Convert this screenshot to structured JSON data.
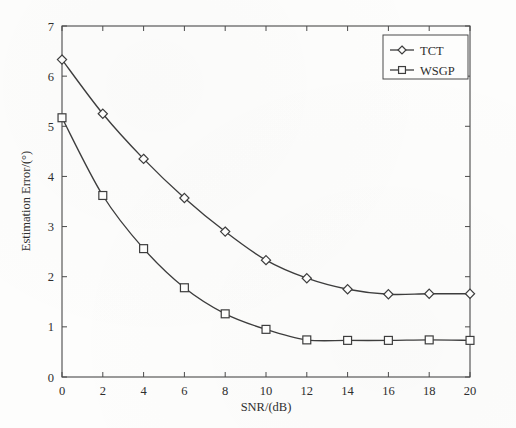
{
  "chart_data": {
    "type": "line",
    "title": "",
    "xlabel": "SNR/(dB)",
    "ylabel": "Estimation Error/(°)",
    "xlim": [
      0,
      20
    ],
    "ylim": [
      0,
      7
    ],
    "xticks": [
      0,
      2,
      4,
      6,
      8,
      10,
      12,
      14,
      16,
      18,
      20
    ],
    "yticks": [
      0,
      1,
      2,
      3,
      4,
      5,
      6,
      7
    ],
    "xtick_labels": [
      "0",
      "2",
      "4",
      "6",
      "8",
      "10",
      "12",
      "14",
      "16",
      "18",
      "20"
    ],
    "ytick_labels": [
      "0",
      "1",
      "2",
      "3",
      "4",
      "5",
      "6",
      "7"
    ],
    "grid": false,
    "legend_position": "upper right",
    "x": [
      0,
      2,
      4,
      6,
      8,
      10,
      12,
      14,
      16,
      18,
      20
    ],
    "series": [
      {
        "name": "TCT",
        "marker": "diamond",
        "values": [
          6.33,
          5.25,
          4.35,
          3.57,
          2.9,
          2.33,
          1.97,
          1.75,
          1.65,
          1.66,
          1.66
        ]
      },
      {
        "name": "WSGP",
        "marker": "square",
        "values": [
          5.17,
          3.62,
          2.56,
          1.78,
          1.26,
          0.95,
          0.74,
          0.73,
          0.73,
          0.74,
          0.73
        ]
      }
    ]
  },
  "legend": {
    "entries": [
      {
        "label": "TCT",
        "marker": "diamond"
      },
      {
        "label": "WSGP",
        "marker": "square"
      }
    ]
  },
  "colors": {
    "line": "#3d3d3d",
    "axis": "#4a4a4a",
    "text": "#2e2e2e",
    "background": "#fdfdfc"
  }
}
